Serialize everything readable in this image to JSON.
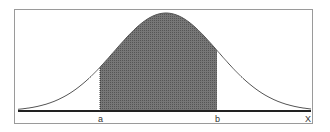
{
  "diagram": {
    "type": "normal-distribution-area",
    "labels": {
      "a": "a",
      "b": "b",
      "x_axis": "X"
    },
    "colors": {
      "shade": "#6a6a6a",
      "curve": "#555555",
      "axis": "#222222",
      "frame": "#9a9a9a"
    }
  }
}
